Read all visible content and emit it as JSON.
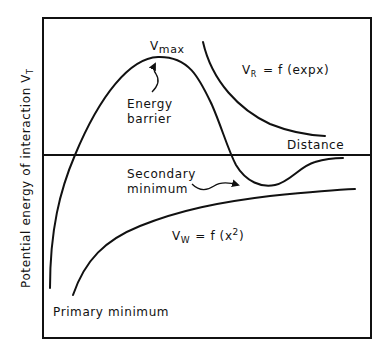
{
  "diagram": {
    "y_axis_label": "Potential energy of interaction V",
    "y_axis_label_subscript": "T",
    "x_axis_label": "Distance",
    "labels": {
      "vmax_main": "V",
      "vmax_sub": "max",
      "energy_barrier_line1": "Energy",
      "energy_barrier_line2": "barrier",
      "vr_main": "V",
      "vr_sub": "R",
      "vr_formula": "= f (expx)",
      "secondary_min_line1": "Secondary",
      "secondary_min_line2": "minimum",
      "vw_main": "V",
      "vw_sub": "W",
      "vw_formula": "= f  (x",
      "vw_sup": "2",
      "vw_close": ")",
      "primary_min": "Primary minimum"
    },
    "curves": [
      "total-interaction-curve",
      "repulsive-curve-VR",
      "attractive-curve-VW"
    ]
  }
}
